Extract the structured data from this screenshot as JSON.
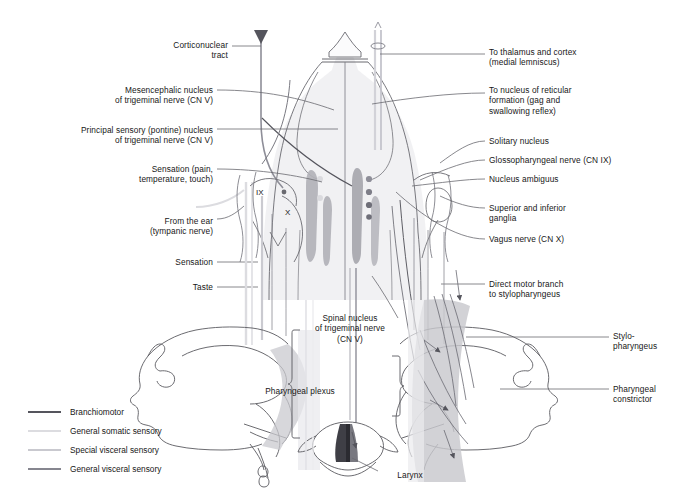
{
  "figure": {
    "background": "#ffffff"
  },
  "colors": {
    "branchiomotor": "#4a4a52",
    "general_somatic_sensory": "#d8d8dc",
    "special_visceral_sensory": "#c2c2c8",
    "general_visceral_sensory": "#8e8e98",
    "outline": "#5a5a60",
    "nucleus_fill": "#a9a9b0",
    "tissue_fill": "#d0d0d4",
    "muscle_fill": "#c6c6cb",
    "text": "#171717"
  },
  "labels_left": [
    {
      "id": "corticonuclear-tract",
      "text": "Corticonuclear\ntract",
      "x": 128,
      "y": 40,
      "w": 100,
      "align": "right"
    },
    {
      "id": "mesencephalic-nucleus",
      "text": "Mesencephalic nucleus\nof trigeminal nerve (CN V)",
      "x": 98,
      "y": 85,
      "w": 115,
      "align": "right"
    },
    {
      "id": "principal-sensory-nucleus",
      "text": "Principal sensory (pontine) nucleus\nof trigeminal nerve (CN V)",
      "x": 56,
      "y": 125,
      "w": 157,
      "align": "right"
    },
    {
      "id": "sensation-pain-temp-touch",
      "text": "Sensation (pain,\ntemperature, touch)",
      "x": 103,
      "y": 164,
      "w": 110,
      "align": "right"
    },
    {
      "id": "from-the-ear",
      "text": "From the ear\n(tympanic nerve)",
      "x": 103,
      "y": 216,
      "w": 110,
      "align": "right"
    },
    {
      "id": "sensation",
      "text": "Sensation",
      "x": 133,
      "y": 259,
      "w": 80,
      "align": "right"
    },
    {
      "id": "taste",
      "text": "Taste",
      "x": 133,
      "y": 283,
      "w": 80,
      "align": "right"
    }
  ],
  "labels_right": [
    {
      "id": "to-thalamus-and-cortex",
      "text": "To thalamus and cortex\n(medial lemniscus)",
      "x": 489,
      "y": 47,
      "w": 180,
      "align": "left"
    },
    {
      "id": "to-nucleus-reticular-formation",
      "text": "To nucleus of reticular\nformation (gag and\nswallowing reflex)",
      "x": 489,
      "y": 85,
      "w": 180,
      "align": "left"
    },
    {
      "id": "solitary-nucleus",
      "text": "Solitary nucleus",
      "x": 489,
      "y": 137,
      "w": 180,
      "align": "left"
    },
    {
      "id": "glossopharyngeal-nerve",
      "text": "Glossopharyngeal nerve (CN IX)",
      "x": 489,
      "y": 156,
      "w": 195,
      "align": "left"
    },
    {
      "id": "nucleus-ambiguus",
      "text": "Nucleus ambiguus",
      "x": 489,
      "y": 175,
      "w": 180,
      "align": "left"
    },
    {
      "id": "superior-and-inferior-ganglia",
      "text": "Superior and inferior\nganglia",
      "x": 489,
      "y": 204,
      "w": 180,
      "align": "left"
    },
    {
      "id": "vagus-nerve",
      "text": "Vagus nerve (CN X)",
      "x": 489,
      "y": 235,
      "w": 180,
      "align": "left"
    },
    {
      "id": "direct-motor-branch",
      "text": "Direct motor branch\nto stylopharyngeus",
      "x": 489,
      "y": 280,
      "w": 180,
      "align": "left"
    },
    {
      "id": "stylopharyngeus",
      "text": "Stylo-\npharyngeus",
      "x": 613,
      "y": 330,
      "w": 75,
      "align": "left"
    },
    {
      "id": "pharyngeal-constrictor",
      "text": "Pharyngeal\nconstrictor",
      "x": 613,
      "y": 384,
      "w": 75,
      "align": "left"
    }
  ],
  "labels_center": [
    {
      "id": "spinal-nucleus-trigeminal",
      "text": "Spinal nucleus\nof trigeminal nerve\n(CN V)",
      "x": 290,
      "y": 313,
      "w": 120,
      "align": "center"
    },
    {
      "id": "pharyngeal-plexus",
      "text": "Pharyngeal plexus",
      "x": 240,
      "y": 386,
      "w": 120,
      "align": "center"
    },
    {
      "id": "larynx",
      "text": "Larynx",
      "x": 380,
      "y": 472,
      "w": 60,
      "align": "center"
    }
  ],
  "nerve_markers": [
    {
      "id": "marker-ix",
      "text": "IX",
      "x": 256,
      "y": 189
    },
    {
      "id": "marker-x",
      "text": "X",
      "x": 285,
      "y": 209
    }
  ],
  "legend": {
    "items": [
      {
        "id": "branchiomotor",
        "label": "Branchiomotor",
        "color": "#55555d"
      },
      {
        "id": "general-somatic-sensory",
        "label": "General somatic sensory",
        "color": "#dcdce0"
      },
      {
        "id": "special-visceral-sensory",
        "label": "Special visceral sensory",
        "color": "#c9c9cf"
      },
      {
        "id": "general-visceral-sensory",
        "label": "General visceral sensory",
        "color": "#86868f"
      }
    ]
  }
}
